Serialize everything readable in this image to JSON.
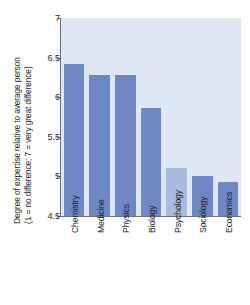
{
  "chart_data": {
    "type": "bar",
    "title": "",
    "xlabel": "",
    "ylabel_line1": "Degree of expertise relative to average person",
    "ylabel_line2": "(1 = no difference; 7 = very great difference)",
    "categories": [
      "Chemistry",
      "Medicine",
      "Physics",
      "Biology",
      "Psychology",
      "Sociology",
      "Economics"
    ],
    "values": [
      6.42,
      6.28,
      6.28,
      5.87,
      5.1,
      5.0,
      4.93
    ],
    "ylim": [
      4.5,
      7
    ],
    "yticks": [
      4.5,
      5,
      5.5,
      6,
      6.5,
      7
    ],
    "ytick_labels": [
      "4.5",
      "5",
      "5.5",
      "6",
      "6.5",
      "7"
    ],
    "grid": false,
    "legend": "none",
    "bar_color": "#6e88c6",
    "highlight_color": "#a9bade",
    "highlight_category": "Psychology",
    "plot_background": "#dde8f4",
    "axis_color": "#6a7078"
  }
}
